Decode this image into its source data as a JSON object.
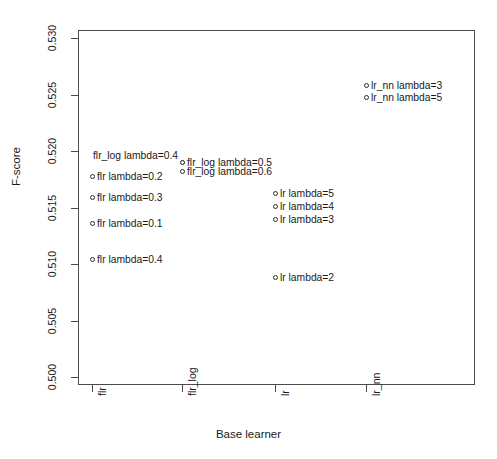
{
  "chart_data": {
    "type": "scatter",
    "title": "",
    "xlabel": "Base learner",
    "ylabel": "F-score",
    "grid": false,
    "legend": null,
    "x_categories": [
      "flr",
      "flr_log",
      "lr",
      "lr_nn"
    ],
    "y_ticks": [
      "0.500",
      "0.505",
      "0.510",
      "0.515",
      "0.520",
      "0.525",
      "0.530"
    ],
    "ylim": [
      0.5,
      0.53
    ],
    "points": [
      {
        "label": "flr lambda=0.2",
        "category": "flr",
        "x": 1,
        "y": 0.5177,
        "label_side": "right"
      },
      {
        "label": "flr lambda=0.3",
        "category": "flr",
        "x": 1,
        "y": 0.5159,
        "label_side": "right"
      },
      {
        "label": "flr lambda=0.1",
        "category": "flr",
        "x": 1,
        "y": 0.5136,
        "label_side": "right"
      },
      {
        "label": "flr lambda=0.4",
        "category": "flr",
        "x": 1,
        "y": 0.5104,
        "label_side": "right"
      },
      {
        "label": "flr_log lambda=0.4",
        "category": "flr_log",
        "x": 2,
        "y": 0.5196,
        "label_side": "left"
      },
      {
        "label": "flr_log lambda=0.5",
        "category": "flr_log",
        "x": 2,
        "y": 0.519,
        "label_side": "right"
      },
      {
        "label": "flr_log lambda=0.6",
        "category": "flr_log",
        "x": 2,
        "y": 0.5182,
        "label_side": "right"
      },
      {
        "label": "lr lambda=5",
        "category": "lr",
        "x": 3,
        "y": 0.5162,
        "label_side": "right"
      },
      {
        "label": "lr lambda=4",
        "category": "lr",
        "x": 3,
        "y": 0.5151,
        "label_side": "right"
      },
      {
        "label": "lr lambda=3",
        "category": "lr",
        "x": 3,
        "y": 0.5139,
        "label_side": "right"
      },
      {
        "label": "lr lambda=2",
        "category": "lr",
        "x": 3,
        "y": 0.5088,
        "label_side": "right"
      },
      {
        "label": "lr_nn lambda=3",
        "category": "lr_nn",
        "x": 4,
        "y": 0.5258,
        "label_side": "right"
      },
      {
        "label": "lr_nn lambda=5",
        "category": "lr_nn",
        "x": 4,
        "y": 0.5247,
        "label_side": "right"
      }
    ]
  },
  "axis": {
    "y_title": "F-score",
    "x_title": "Base learner",
    "y_tick_labels": [
      "0.530",
      "0.525",
      "0.520",
      "0.515",
      "0.510",
      "0.505",
      "0.500"
    ],
    "x_tick_labels": [
      "flr",
      "flr_log",
      "lr",
      "lr_nn"
    ]
  },
  "point_labels": [
    "flr lambda=0.2",
    "flr lambda=0.3",
    "flr lambda=0.1",
    "flr lambda=0.4",
    "flr_log lambda=0.4",
    "flr_log lambda=0.5",
    "flr_log lambda=0.6",
    "lr lambda=5",
    "lr lambda=4",
    "lr lambda=3",
    "lr lambda=2",
    "lr_nn lambda=3",
    "lr_nn lambda=5"
  ],
  "colors": {
    "frame": "#4a4a4a",
    "marker": "#2b2b2b",
    "text": "#1a1a1a",
    "background": "#ffffff"
  }
}
